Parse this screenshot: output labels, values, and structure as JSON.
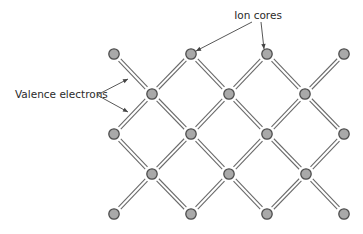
{
  "figure": {
    "type": "crystal-lattice-diagram",
    "colors": {
      "node_fill": "#a9a9a9",
      "node_stroke": "#4d4d4d",
      "bond": "#6a6a6a",
      "text": "#2a2a2a",
      "background": "#ffffff"
    }
  },
  "labels": {
    "ion_cores": "Ion cores",
    "valence_electrons": "Valence electrons"
  },
  "lattice": {
    "nodes": [
      {
        "x": 114,
        "y": 54
      },
      {
        "x": 191,
        "y": 54
      },
      {
        "x": 267,
        "y": 54
      },
      {
        "x": 344,
        "y": 54
      },
      {
        "x": 152,
        "y": 94
      },
      {
        "x": 229,
        "y": 94
      },
      {
        "x": 305,
        "y": 94
      },
      {
        "x": 114,
        "y": 134
      },
      {
        "x": 191,
        "y": 134
      },
      {
        "x": 267,
        "y": 134
      },
      {
        "x": 344,
        "y": 134
      },
      {
        "x": 152,
        "y": 174
      },
      {
        "x": 229,
        "y": 174
      },
      {
        "x": 306,
        "y": 174
      },
      {
        "x": 114,
        "y": 214
      },
      {
        "x": 191,
        "y": 214
      },
      {
        "x": 267,
        "y": 214
      },
      {
        "x": 344,
        "y": 214
      }
    ],
    "bonds": [
      [
        0,
        4
      ],
      [
        1,
        4
      ],
      [
        1,
        5
      ],
      [
        2,
        5
      ],
      [
        2,
        6
      ],
      [
        3,
        6
      ],
      [
        4,
        7
      ],
      [
        4,
        8
      ],
      [
        5,
        8
      ],
      [
        5,
        9
      ],
      [
        6,
        9
      ],
      [
        6,
        10
      ],
      [
        7,
        11
      ],
      [
        8,
        11
      ],
      [
        8,
        12
      ],
      [
        9,
        12
      ],
      [
        9,
        13
      ],
      [
        10,
        13
      ],
      [
        11,
        14
      ],
      [
        11,
        15
      ],
      [
        12,
        15
      ],
      [
        12,
        16
      ],
      [
        13,
        16
      ],
      [
        13,
        17
      ]
    ],
    "node_radius": 5.2,
    "bond_gap": 3.2
  },
  "annotations": {
    "ion_cores": {
      "text_x": 258,
      "text_y": 19,
      "targets": [
        [
          196,
          51
        ],
        [
          264,
          49
        ]
      ],
      "origin": [
        [
          252,
          22
        ],
        [
          261,
          22
        ]
      ]
    },
    "valence_electrons": {
      "text_x": 15,
      "text_y": 98,
      "origin": [
        97,
        95
      ],
      "targets": [
        [
          128,
          79
        ],
        [
          128,
          112
        ]
      ]
    }
  }
}
